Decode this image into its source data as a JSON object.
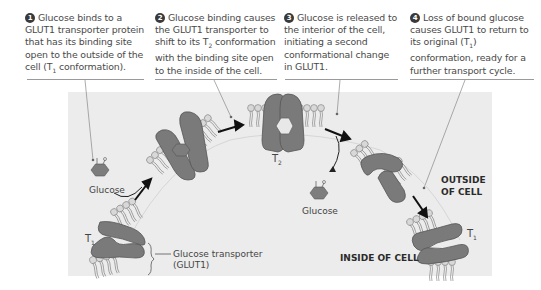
{
  "captions": [
    {
      "num": "1",
      "text": "Glucose binds to a GLUT1 transporter protein that has its binding site open to the outside of the cell (T",
      "sub": "1",
      "tail": " conformation)."
    },
    {
      "num": "2",
      "text": "Glucose binding causes the GLUT1 transporter to shift to its T",
      "sub": "2",
      "tail": " conformation with the binding site open to the inside of the cell."
    },
    {
      "num": "3",
      "text": "Glucose is released to the interior of the cell, initiating a second conformational change in GLUT1.",
      "sub": "",
      "tail": ""
    },
    {
      "num": "4",
      "text": "Loss of bound glucose causes GLUT1 to return to its original (T",
      "sub": "1",
      "tail": ") conformation, ready for a further transport cycle."
    }
  ],
  "labels": {
    "glucose_1": "Glucose",
    "glucose_2": "Glucose",
    "t1_left": "T",
    "t1_left_sub": "1",
    "t2": "T",
    "t2_sub": "2",
    "t1_right": "T",
    "t1_right_sub": "1",
    "transporter_line1": "Glucose transporter",
    "transporter_line2": "(GLUT1)",
    "outside_line1": "OUTSIDE",
    "outside_line2": "OF CELL",
    "inside": "INSIDE OF CELL"
  },
  "colors": {
    "panel": "#ececec",
    "protein": "#7a7a7a",
    "membrane_head": "#d4d4d4",
    "text": "#4a4a4a"
  }
}
